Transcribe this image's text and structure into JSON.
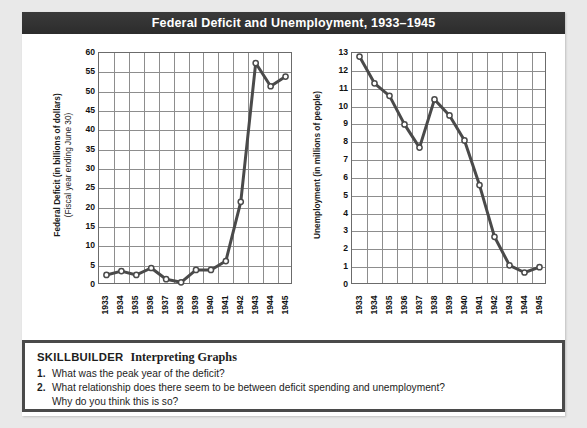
{
  "figure": {
    "title": "Federal Deficit and Unemployment, 1933–1945",
    "title_bar_color": "#333333",
    "background_color": "#e9e9e9",
    "card_color": "#ffffff",
    "grid_color": "#8d8d8d",
    "axis_color": "#6b6b6b",
    "line_color": "#4a4a4a",
    "marker_fill": "#ffffff"
  },
  "skillbuilder": {
    "heading_label": "SKILLBUILDER",
    "heading_subtitle": "Interpreting Graphs",
    "questions": [
      {
        "number": "1.",
        "text": "What was the peak year of the deficit?",
        "continuation": ""
      },
      {
        "number": "2.",
        "text": "What relationship does there seem to be between deficit spending and unemployment?",
        "continuation": "Why do you think this is so?"
      }
    ]
  },
  "chart_data": [
    {
      "id": "federal-deficit",
      "type": "line",
      "title": "Federal Deficit and Unemployment, 1933–1945",
      "ylabel_line1": "Federal Deficit (in billions of dollars)",
      "ylabel_line2": "(Fiscal year ending June 30)",
      "xlabel": "",
      "categories": [
        "1933",
        "1934",
        "1935",
        "1936",
        "1937",
        "1938",
        "1939",
        "1940",
        "1941",
        "1942",
        "1943",
        "1944",
        "1945"
      ],
      "values": [
        2.6,
        3.6,
        2.6,
        4.4,
        1.5,
        0.7,
        3.9,
        3.9,
        6.2,
        21.5,
        57.4,
        51.4,
        53.9
      ],
      "ylim": [
        0,
        60
      ],
      "yticks": [
        0,
        5,
        10,
        15,
        20,
        25,
        30,
        35,
        40,
        45,
        50,
        55,
        60
      ],
      "grid": true,
      "legend": "none",
      "markers": "open-circle"
    },
    {
      "id": "unemployment",
      "type": "line",
      "title": "Federal Deficit and Unemployment, 1933–1945",
      "ylabel_line1": "Unemployment (in millions of people)",
      "ylabel_line2": "",
      "xlabel": "",
      "categories": [
        "1933",
        "1934",
        "1935",
        "1936",
        "1937",
        "1938",
        "1939",
        "1940",
        "1941",
        "1942",
        "1943",
        "1944",
        "1945"
      ],
      "values": [
        12.8,
        11.3,
        10.6,
        9.0,
        7.7,
        10.4,
        9.5,
        8.1,
        5.6,
        2.7,
        1.1,
        0.7,
        1.0
      ],
      "ylim": [
        0,
        13
      ],
      "yticks": [
        0,
        1,
        2,
        3,
        4,
        5,
        6,
        7,
        8,
        9,
        10,
        11,
        12,
        13
      ],
      "grid": true,
      "legend": "none",
      "markers": "open-circle"
    }
  ]
}
